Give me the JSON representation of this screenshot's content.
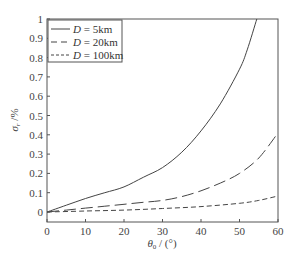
{
  "chart_data": {
    "type": "line",
    "title": "",
    "xlabel": "θ₀ / (°)",
    "ylabel": "σr/%",
    "xlim": [
      0,
      60
    ],
    "ylim": [
      0,
      1
    ],
    "xticks": [
      0,
      10,
      20,
      30,
      40,
      50,
      60
    ],
    "yticks": [
      0,
      0.1,
      0.2,
      0.3,
      0.4,
      0.5,
      0.6,
      0.7,
      0.8,
      0.9,
      1
    ],
    "ytick_labels": [
      "0",
      "0.1",
      "0.2",
      "0.3",
      "0.4",
      "0.5",
      "0.6",
      "0.7",
      "0.8",
      "0.9",
      "1"
    ],
    "grid": false,
    "legend_position": "upper left",
    "series": [
      {
        "name": "D = 5km",
        "style": "solid",
        "x": [
          0,
          5,
          10,
          15,
          20,
          25,
          30,
          35,
          40,
          45,
          50,
          52,
          54.5
        ],
        "y": [
          0,
          0.035,
          0.07,
          0.1,
          0.13,
          0.18,
          0.23,
          0.31,
          0.42,
          0.56,
          0.74,
          0.84,
          1.0
        ]
      },
      {
        "name": "D = 20km",
        "style": "long-dash",
        "x": [
          0,
          5,
          10,
          15,
          20,
          25,
          30,
          35,
          40,
          45,
          50,
          55,
          60
        ],
        "y": [
          0,
          0.01,
          0.02,
          0.03,
          0.04,
          0.05,
          0.06,
          0.08,
          0.11,
          0.15,
          0.2,
          0.28,
          0.41
        ]
      },
      {
        "name": "D = 100km",
        "style": "short-dash",
        "x": [
          0,
          10,
          20,
          30,
          40,
          50,
          55,
          60
        ],
        "y": [
          0,
          0.005,
          0.01,
          0.018,
          0.028,
          0.045,
          0.06,
          0.083
        ]
      }
    ]
  },
  "legend": {
    "items": [
      {
        "prefix": "D",
        "suffix": " = 5km"
      },
      {
        "prefix": "D",
        "suffix": " = 20km"
      },
      {
        "prefix": "D",
        "suffix": " = 100km"
      }
    ]
  },
  "axes": {
    "xlabel_theta": "θ",
    "xlabel_sub": "0",
    "xlabel_rest": " / (°)",
    "ylabel_sigma": "σ",
    "ylabel_sub": "r",
    "ylabel_rest": " /%"
  }
}
